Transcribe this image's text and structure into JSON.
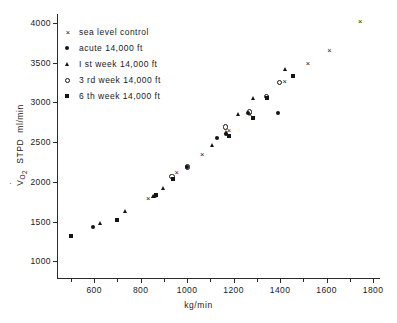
{
  "chart_data": {
    "type": "scatter",
    "title": "",
    "xlabel": "kg/min",
    "ylabel": "V̇O₂ STPD ml/min",
    "ylabel_parts": {
      "v": "V",
      "sub": "O₂",
      "rest": " STPD  ml/min"
    },
    "xlim": [
      440,
      1830
    ],
    "ylim": [
      790,
      4060
    ],
    "xticks": [
      600,
      800,
      1000,
      1200,
      1400,
      1600,
      1800
    ],
    "xticklabels": [
      "600",
      "800",
      "1000",
      "1200",
      "1400",
      "1600",
      "1800"
    ],
    "xminorticks": [
      500,
      700,
      900,
      1100,
      1300,
      1500,
      1700
    ],
    "yticks": [
      1000,
      1500,
      2000,
      2500,
      3000,
      3500,
      4000
    ],
    "yticklabels": [
      "1000",
      "1500",
      "2000",
      "2500",
      "3000",
      "3500",
      "4000"
    ],
    "grid": false,
    "legend_position": "upper left",
    "series": [
      {
        "name": "sea level control",
        "marker": "x",
        "points": [
          [
            832,
            1778
          ],
          [
            955,
            2110
          ],
          [
            1065,
            2338
          ],
          [
            1180,
            2645
          ],
          [
            1270,
            2840
          ],
          [
            1345,
            3060
          ],
          [
            1420,
            3250
          ],
          [
            1520,
            3480
          ],
          [
            1612,
            3650
          ],
          [
            1745,
            4010
          ]
        ]
      },
      {
        "name": "acute 14,000 ft",
        "marker": "filled-circle",
        "points": [
          [
            596,
            1432
          ],
          [
            862,
            1822
          ],
          [
            1000,
            2185
          ],
          [
            1130,
            2555
          ],
          [
            1168,
            2600
          ],
          [
            1262,
            2865
          ],
          [
            1392,
            2870
          ]
        ]
      },
      {
        "name": "1 st week 14,000 ft",
        "marker": "filled-triangle",
        "points": [
          [
            628,
            1468
          ],
          [
            735,
            1618
          ],
          [
            855,
            1812
          ],
          [
            898,
            1918
          ],
          [
            1110,
            2450
          ],
          [
            1170,
            2615
          ],
          [
            1222,
            2845
          ],
          [
            1288,
            3040
          ],
          [
            1422,
            3410
          ]
        ]
      },
      {
        "name": "3 rd week 14,000 ft",
        "marker": "open-circle",
        "points": [
          [
            935,
            2068
          ],
          [
            1000,
            2188
          ],
          [
            1165,
            2690
          ],
          [
            1268,
            2880
          ],
          [
            1340,
            3075
          ],
          [
            1398,
            3250
          ]
        ]
      },
      {
        "name": "6 th week 14,000 ft",
        "marker": "filled-square",
        "points": [
          [
            500,
            1315
          ],
          [
            698,
            1522
          ],
          [
            866,
            1835
          ],
          [
            938,
            2035
          ],
          [
            1182,
            2570
          ],
          [
            1285,
            2800
          ],
          [
            1345,
            3055
          ],
          [
            1455,
            3325
          ]
        ]
      }
    ]
  },
  "legend": {
    "items": [
      {
        "marker": "x",
        "label": "sea level control"
      },
      {
        "marker": "filled-circle",
        "label": "acute  14,000 ft"
      },
      {
        "marker": "filled-triangle",
        "label": "I st week  14,000 ft"
      },
      {
        "marker": "open-circle",
        "label": "3 rd week  14,000 ft"
      },
      {
        "marker": "filled-square",
        "label": "6 th week  14,000 ft"
      }
    ]
  },
  "colors": {
    "ink": "#141414",
    "axis": "#2b2b2b",
    "background": "#ffffff"
  }
}
